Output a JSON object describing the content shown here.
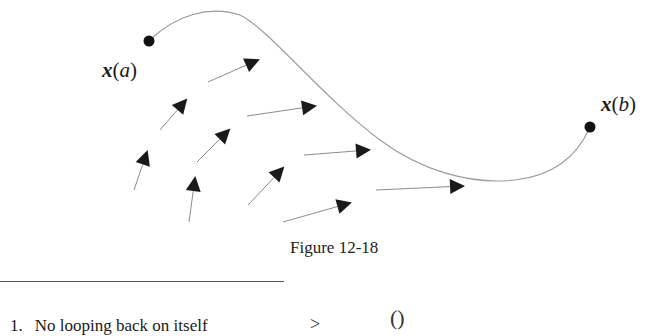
{
  "figure": {
    "caption": "Figure 12-18",
    "start_point": {
      "label_var": "x",
      "label_arg": "a",
      "label_open": "(",
      "label_close": ")",
      "x": 149,
      "y": 41
    },
    "end_point": {
      "label_var": "x",
      "label_arg": "b",
      "label_open": "(",
      "label_close": ")",
      "x": 590,
      "y": 127
    },
    "curve_path": "M149,41 C175,15 210,5 240,15 C270,30 320,95 380,140 C420,170 470,185 515,180 C560,175 580,150 590,127",
    "vector_field": [
      {
        "x1": 208,
        "y1": 82,
        "x2": 258,
        "y2": 60
      },
      {
        "x1": 160,
        "y1": 130,
        "x2": 186,
        "y2": 100
      },
      {
        "x1": 247,
        "y1": 116,
        "x2": 315,
        "y2": 106
      },
      {
        "x1": 134,
        "y1": 190,
        "x2": 147,
        "y2": 152
      },
      {
        "x1": 197,
        "y1": 162,
        "x2": 229,
        "y2": 130
      },
      {
        "x1": 304,
        "y1": 155,
        "x2": 369,
        "y2": 150
      },
      {
        "x1": 189,
        "y1": 222,
        "x2": 195,
        "y2": 178
      },
      {
        "x1": 248,
        "y1": 205,
        "x2": 283,
        "y2": 168
      },
      {
        "x1": 376,
        "y1": 190,
        "x2": 463,
        "y2": 186
      },
      {
        "x1": 283,
        "y1": 222,
        "x2": 350,
        "y2": 203
      }
    ],
    "colors": {
      "curve": "#9a9a9a",
      "arrow_shaft": "#8c8c8c",
      "arrow_head": "#1a1a1a",
      "point": "#111111"
    }
  },
  "text_below": {
    "item_number": "1.",
    "item_text": "No looping back on itself",
    "symbol_gt": ">",
    "symbol_paren": "()"
  }
}
